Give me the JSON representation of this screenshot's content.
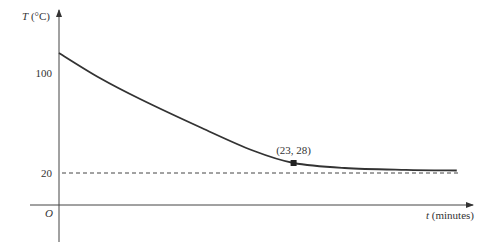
{
  "chart_data": {
    "type": "line",
    "title": "",
    "xlabel": "t (minutes)",
    "ylabel": "T (°C)",
    "xlabel_var": "t",
    "xlabel_unit": "(minutes)",
    "ylabel_var": "T",
    "ylabel_unit": "(°C)",
    "origin_label": "O",
    "y_ticks": [
      {
        "value": 100,
        "label": "100"
      },
      {
        "value": 20,
        "label": "20"
      }
    ],
    "asymptote": {
      "y": 20,
      "style": "dashed"
    },
    "series": [
      {
        "name": "Cooling curve",
        "x": [
          0,
          4,
          8,
          14,
          19,
          23,
          28,
          34,
          39
        ],
        "y": [
          116,
          96,
          79,
          56,
          38,
          28,
          24,
          22.5,
          22
        ]
      }
    ],
    "annotations": [
      {
        "x": 23,
        "y": 28,
        "text": "(23, 28)",
        "marker": "square"
      }
    ],
    "grid": false,
    "legend": null
  },
  "geometry": {
    "origin_x": 59,
    "origin_y": 205,
    "x_axis_end": 473,
    "y_axis_top": 10,
    "y_axis_bottom": 242,
    "px_per_minute": 10.2,
    "y20_px": 173,
    "y100_px": 73
  }
}
